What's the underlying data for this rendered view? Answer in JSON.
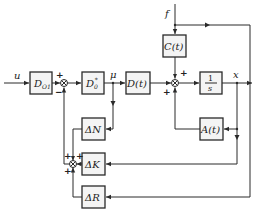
{
  "diagram": {
    "type": "control-system-block-diagram",
    "signals": {
      "input": "u",
      "disturbance": "f",
      "control": "μ",
      "output": "x"
    },
    "blocks": [
      {
        "id": "d-o1",
        "label": "D",
        "sub": "O1"
      },
      {
        "id": "d-0-star",
        "label": "D",
        "sub": "0",
        "sup": "*"
      },
      {
        "id": "d-t",
        "label": "D(t)"
      },
      {
        "id": "c-t",
        "label": "C(t)"
      },
      {
        "id": "integrator",
        "num": "1",
        "den": "s"
      },
      {
        "id": "a-t",
        "label": "A(t)"
      },
      {
        "id": "delta-n",
        "label": "ΔN"
      },
      {
        "id": "delta-k",
        "label": "ΔK"
      },
      {
        "id": "delta-r",
        "label": "ΔR"
      }
    ],
    "summing_junctions": [
      {
        "id": "sum-1",
        "signs": [
          "+",
          "−"
        ]
      },
      {
        "id": "sum-2",
        "signs": [
          "+",
          "+"
        ]
      },
      {
        "id": "sum-3",
        "signs": [
          "+",
          "+",
          "+"
        ]
      }
    ]
  }
}
